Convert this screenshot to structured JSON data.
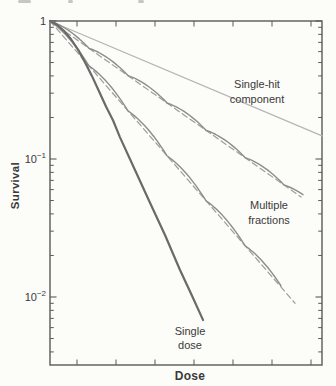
{
  "figure": {
    "type": "scientific-figure",
    "description_visible_text_only": true,
    "cropped_caption_fragments": [
      {
        "x": 18,
        "w": 13
      },
      {
        "x": 68,
        "w": 5
      },
      {
        "x": 138,
        "w": 6
      }
    ]
  },
  "colors": {
    "page_background": "#fcfcf9",
    "axis": "#5a5a5a",
    "text": "#3a3a3a",
    "single_hit_line": "#b5b5b5",
    "fraction_solid": "#8d8d8d",
    "fraction_dashed": "#9d9d9d",
    "single_dose_line": "#6a6a6a"
  },
  "chart_data": {
    "type": "line",
    "title": "",
    "xlabel": "Dose",
    "ylabel": "Survival",
    "box_px": {
      "x": 50,
      "y": 21,
      "w": 272,
      "h": 344,
      "decade_h": 138
    },
    "x_axis": {
      "scale": "linear",
      "labeled": false,
      "note": "seven unlabeled tick marks, ticks on top and bottom edges",
      "tick_fracs": [
        0.0993,
        0.2426,
        0.386,
        0.5294,
        0.6728,
        0.8162,
        0.9596
      ]
    },
    "y_axis": {
      "scale": "log",
      "range": [
        0.0032,
        1
      ],
      "ticks": [
        {
          "s": 1,
          "label": "1"
        },
        {
          "s": 0.1,
          "label": "10^−1"
        },
        {
          "s": 0.01,
          "label": "10^−2"
        }
      ],
      "minor_ticks": "log minors 0.9–0.2, 0.09–0.02, 0.009–0.004 on left and right edges"
    },
    "grid": false,
    "legend": "none (direct curve annotations)",
    "curves": [
      {
        "id": "single-hit",
        "label": "Single-hit component",
        "kind": "straight",
        "dashed": false,
        "color_key": "single_hit_line",
        "width": 1.3,
        "start": {
          "frac": 0,
          "survival": 1
        },
        "end": {
          "frac": 1.0,
          "survival": 0.147
        }
      },
      {
        "id": "multi-upper-dashed",
        "label": "Multiple fractions (upper, effective slope)",
        "kind": "straight",
        "dashed": true,
        "color_key": "fraction_dashed",
        "width": 1.2,
        "start": {
          "frac": 0,
          "survival": 1
        },
        "end": {
          "frac": 0.923,
          "survival": 0.053
        }
      },
      {
        "id": "multi-upper-solid",
        "label": "Multiple fractions (upper, scalloped)",
        "kind": "scalloped",
        "dashed": false,
        "color_key": "fraction_solid",
        "width": 1.4,
        "start": {
          "frac": 0,
          "survival": 1
        },
        "end": {
          "frac": 0.93,
          "survival": 0.052
        },
        "period_px": 39,
        "amplitude_px": 3.5,
        "fraction_node_survival": [
          0.63,
          0.4,
          0.26,
          0.16,
          0.1,
          0.065
        ]
      },
      {
        "id": "multi-lower-dashed",
        "label": "Multiple fractions (lower, effective slope)",
        "kind": "straight",
        "dashed": true,
        "color_key": "fraction_dashed",
        "width": 1.2,
        "start": {
          "frac": 0,
          "survival": 1
        },
        "end": {
          "frac": 0.901,
          "survival": 0.009
        }
      },
      {
        "id": "multi-lower-solid",
        "label": "Multiple fractions (lower, scalloped)",
        "kind": "scalloped",
        "dashed": false,
        "color_key": "fraction_solid",
        "width": 1.4,
        "start": {
          "frac": 0,
          "survival": 1
        },
        "end": {
          "frac": 0.849,
          "survival": 0.0118
        },
        "period_px": 39,
        "amplitude_px": 4.5,
        "fraction_node_survival": [
          0.47,
          0.22,
          0.106,
          0.05,
          0.024
        ]
      },
      {
        "id": "single-dose",
        "label": "Single dose",
        "kind": "poly",
        "dashed": false,
        "color_key": "single_dose_line",
        "width": 2.2,
        "points": [
          [
            0,
            1
          ],
          [
            0.026,
            0.94
          ],
          [
            0.051,
            0.85
          ],
          [
            0.077,
            0.74
          ],
          [
            0.103,
            0.62
          ],
          [
            0.129,
            0.5
          ],
          [
            0.154,
            0.4
          ],
          [
            0.18,
            0.31
          ],
          [
            0.206,
            0.24
          ],
          [
            0.232,
            0.19
          ],
          [
            0.257,
            0.144
          ],
          [
            0.313,
            0.083
          ],
          [
            0.368,
            0.048
          ],
          [
            0.423,
            0.028
          ],
          [
            0.478,
            0.0157
          ],
          [
            0.522,
            0.0102
          ],
          [
            0.563,
            0.0068
          ]
        ]
      }
    ],
    "annotations": [
      {
        "id": "single-hit-label",
        "lines": [
          "Single-hit",
          "component"
        ],
        "x": 257,
        "y": 84,
        "line_h": 15
      },
      {
        "id": "multiple-fractions-label",
        "lines": [
          "Multiple",
          "fractions"
        ],
        "x": 269,
        "y": 205,
        "line_h": 15
      },
      {
        "id": "single-dose-label",
        "lines": [
          "Single",
          "dose"
        ],
        "x": 190,
        "y": 331,
        "line_h": 14
      }
    ]
  }
}
